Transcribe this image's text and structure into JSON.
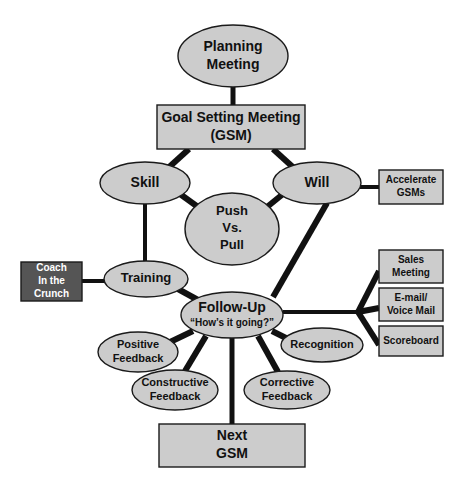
{
  "diagram": {
    "colors": {
      "node_fill": "#CCCCCC",
      "node_stroke": "#1A1A1A",
      "dark_node_fill": "#555555",
      "dark_node_text": "#FFFFFF",
      "node_text": "#111111",
      "edge": "#111111",
      "background": "#FFFFFF"
    },
    "nodes": [
      {
        "id": "planning-meeting",
        "shape": "ellipse",
        "lines": [
          "Planning",
          "Meeting"
        ],
        "cx": 233,
        "cy": 56,
        "rx": 55,
        "ry": 31,
        "font_size": 14,
        "style": "light"
      },
      {
        "id": "goal-setting-meeting",
        "shape": "rect",
        "lines": [
          "Goal Setting Meeting",
          "(GSM)"
        ],
        "x": 157,
        "y": 105,
        "w": 148,
        "h": 44,
        "font_size": 14,
        "style": "light"
      },
      {
        "id": "skill",
        "shape": "ellipse",
        "lines": [
          "Skill"
        ],
        "cx": 145,
        "cy": 183,
        "rx": 45,
        "ry": 21,
        "font_size": 14,
        "style": "light"
      },
      {
        "id": "will",
        "shape": "ellipse",
        "lines": [
          "Will"
        ],
        "cx": 317,
        "cy": 183,
        "rx": 44,
        "ry": 21,
        "font_size": 14,
        "style": "light"
      },
      {
        "id": "push-vs-pull",
        "shape": "ellipse",
        "lines": [
          "Push",
          "Vs.",
          "Pull"
        ],
        "cx": 232,
        "cy": 229,
        "rx": 47,
        "ry": 36,
        "font_size": 13,
        "style": "light"
      },
      {
        "id": "accelerate-gsms",
        "shape": "rect",
        "lines": [
          "Accelerate",
          "GSMs"
        ],
        "x": 379,
        "y": 170,
        "w": 64,
        "h": 34,
        "font_size": 10,
        "style": "light"
      },
      {
        "id": "coach-in-the-crunch",
        "shape": "rect",
        "lines": [
          "Coach",
          "In the",
          "Crunch"
        ],
        "x": 21,
        "y": 262,
        "w": 61,
        "h": 39,
        "font_size": 10,
        "style": "dark"
      },
      {
        "id": "training",
        "shape": "ellipse",
        "lines": [
          "Training"
        ],
        "cx": 146,
        "cy": 279,
        "rx": 42,
        "ry": 18,
        "font_size": 13,
        "style": "light"
      },
      {
        "id": "follow-up",
        "shape": "ellipse",
        "lines": [
          "Follow-Up",
          "“How’s it going?”"
        ],
        "cx": 232,
        "cy": 315,
        "rx": 51,
        "ry": 23,
        "font_size": 14,
        "sub_font_size": 10,
        "style": "light"
      },
      {
        "id": "sales-meeting",
        "shape": "rect",
        "lines": [
          "Sales",
          "Meeting"
        ],
        "x": 379,
        "y": 250,
        "w": 64,
        "h": 33,
        "font_size": 10,
        "style": "light"
      },
      {
        "id": "email-voice-mail",
        "shape": "rect",
        "lines": [
          "E-mail/",
          "Voice Mail"
        ],
        "x": 379,
        "y": 288,
        "w": 64,
        "h": 33,
        "font_size": 10,
        "style": "light"
      },
      {
        "id": "scoreboard",
        "shape": "rect",
        "lines": [
          "Scoreboard"
        ],
        "x": 379,
        "y": 326,
        "w": 64,
        "h": 30,
        "font_size": 10,
        "style": "light"
      },
      {
        "id": "positive-feedback",
        "shape": "ellipse",
        "lines": [
          "Positive",
          "Feedback"
        ],
        "cx": 138,
        "cy": 352,
        "rx": 40,
        "ry": 20,
        "font_size": 11,
        "style": "light"
      },
      {
        "id": "recognition",
        "shape": "ellipse",
        "lines": [
          "Recognition"
        ],
        "cx": 322,
        "cy": 345,
        "rx": 41,
        "ry": 17,
        "font_size": 11,
        "style": "light"
      },
      {
        "id": "constructive-feedback",
        "shape": "ellipse",
        "lines": [
          "Constructive",
          "Feedback"
        ],
        "cx": 175,
        "cy": 390,
        "rx": 43,
        "ry": 20,
        "font_size": 11,
        "style": "light"
      },
      {
        "id": "corrective-feedback",
        "shape": "ellipse",
        "lines": [
          "Corrective",
          "Feedback"
        ],
        "cx": 287,
        "cy": 390,
        "rx": 43,
        "ry": 19,
        "font_size": 11,
        "style": "light"
      },
      {
        "id": "next-gsm",
        "shape": "rect",
        "lines": [
          "Next",
          "GSM"
        ],
        "x": 159,
        "y": 424,
        "w": 146,
        "h": 43,
        "font_size": 14,
        "style": "light"
      }
    ],
    "edges": [
      {
        "id": "planning-to-gsm",
        "from": "planning-meeting",
        "to": "goal-setting-meeting",
        "points": "233,86 233,106",
        "width": 5
      },
      {
        "id": "gsm-to-skill",
        "from": "goal-setting-meeting",
        "to": "skill",
        "points": "189,149 167,169",
        "width": 6
      },
      {
        "id": "gsm-to-will",
        "from": "goal-setting-meeting",
        "to": "will",
        "points": "273,149 295,169",
        "width": 6
      },
      {
        "id": "skill-to-push",
        "from": "skill",
        "to": "push-vs-pull",
        "points": "180,194 198,207",
        "width": 6
      },
      {
        "id": "will-to-push",
        "from": "will",
        "to": "push-vs-pull",
        "points": "283,194 267,207",
        "width": 6
      },
      {
        "id": "will-to-accelerate",
        "from": "will",
        "to": "accelerate-gsms",
        "points": "360,187 379,187",
        "width": 4
      },
      {
        "id": "skill-to-training",
        "from": "skill",
        "to": "training",
        "points": "145,204 145,261",
        "width": 4
      },
      {
        "id": "will-to-followup",
        "from": "will",
        "to": "follow-up",
        "points": "327,203 273,297",
        "width": 6
      },
      {
        "id": "coach-to-training",
        "from": "coach-in-the-crunch",
        "to": "training",
        "points": "82,281 105,281",
        "width": 4
      },
      {
        "id": "training-to-followup",
        "from": "training",
        "to": "follow-up",
        "points": "178,289 198,300",
        "width": 6
      },
      {
        "id": "followup-to-positive",
        "from": "follow-up",
        "to": "positive-feedback",
        "points": "193,331 168,343",
        "width": 6
      },
      {
        "id": "followup-to-constructive",
        "from": "follow-up",
        "to": "constructive-feedback",
        "points": "206,336 185,371",
        "width": 6
      },
      {
        "id": "followup-to-nextgsm",
        "from": "follow-up",
        "to": "next-gsm",
        "points": "232,338 232,424",
        "width": 5
      },
      {
        "id": "followup-to-corrective",
        "from": "follow-up",
        "to": "corrective-feedback",
        "points": "258,336 278,372",
        "width": 6
      },
      {
        "id": "followup-to-recognition",
        "from": "follow-up",
        "to": "recognition",
        "points": "272,331 292,341",
        "width": 6
      },
      {
        "id": "followup-to-hub",
        "from": "follow-up",
        "to": "right-branch-hub",
        "points": "283,312 358,312",
        "width": 4
      },
      {
        "id": "hub-to-sales",
        "from": "right-branch-hub",
        "to": "sales-meeting",
        "points": "358,312 379,271",
        "width": 6
      },
      {
        "id": "hub-to-email",
        "from": "right-branch-hub",
        "to": "email-voice-mail",
        "points": "358,312 379,308",
        "width": 6
      },
      {
        "id": "hub-to-scoreboard",
        "from": "right-branch-hub",
        "to": "scoreboard",
        "points": "358,312 379,345",
        "width": 6
      }
    ]
  }
}
